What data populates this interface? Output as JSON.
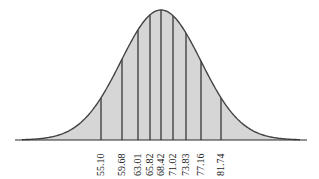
{
  "chart_data": {
    "type": "area",
    "title": "",
    "xlabel": "",
    "ylabel": "",
    "mean": 68.42,
    "tick_labels": [
      "55.10",
      "59.68",
      "63.01",
      "65.82",
      "68.42",
      "71.02",
      "73.83",
      "77.16",
      "81.74"
    ],
    "x": [
      55.1,
      59.68,
      63.01,
      65.82,
      68.42,
      71.02,
      73.83,
      77.16,
      81.74
    ],
    "grid": false,
    "legend": null
  },
  "style": {
    "fill": "#d6d6d6",
    "stroke": "#444444",
    "line": "#2a2a2a"
  },
  "layout": {
    "baseline_y": 140,
    "axis_x0": 15,
    "axis_x1": 307,
    "curve_x0": 22,
    "curve_x1": 300,
    "peak_x": 161,
    "peak_y": 10,
    "line_px": [
      101,
      122,
      138,
      150,
      161,
      173,
      186,
      201,
      221
    ]
  }
}
